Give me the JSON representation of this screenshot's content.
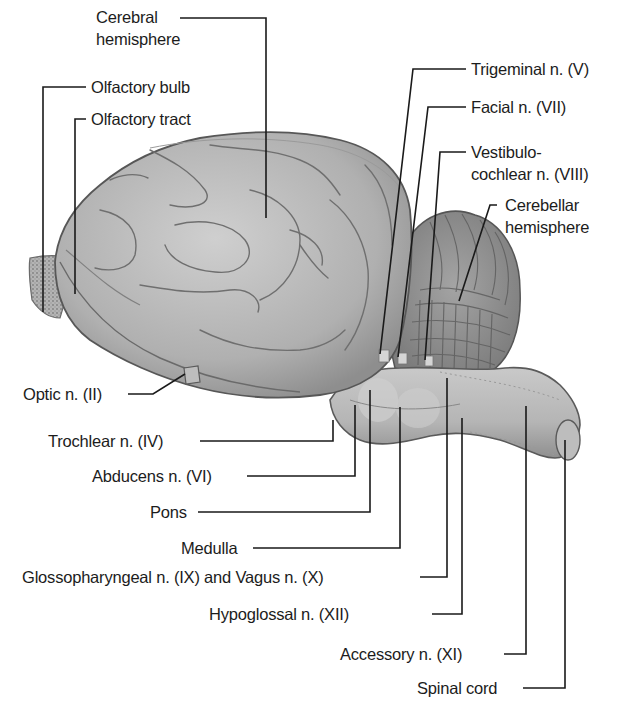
{
  "figure": {
    "colors": {
      "tissue_base": "#a9a9a9",
      "tissue_light": "#c8c8c8",
      "tissue_dark": "#7a7a7a",
      "outline": "#5a5a5a",
      "leader_line": "#1a1a1a",
      "background": "#ffffff"
    }
  },
  "labels": {
    "cerebral_hemisphere": {
      "line1": "Cerebral",
      "line2": "hemisphere"
    },
    "olfactory_bulb": "Olfactory bulb",
    "olfactory_tract": "Olfactory tract",
    "trigeminal": "Trigeminal n. (V)",
    "facial": "Facial n. (VII)",
    "vestibulocochlear": {
      "line1": "Vestibulo-",
      "line2": "cochlear n. (VIII)"
    },
    "cerebellar_hemisphere": {
      "line1": "Cerebellar",
      "line2": "hemisphere"
    },
    "optic": "Optic n. (II)",
    "trochlear": "Trochlear n. (IV)",
    "abducens": "Abducens n. (VI)",
    "pons": "Pons",
    "medulla": "Medulla",
    "glossopharyngeal_vagus": "Glossopharyngeal n. (IX) and Vagus n. (X)",
    "hypoglossal": "Hypoglossal n. (XII)",
    "accessory": "Accessory n. (XI)",
    "spinal_cord": "Spinal cord"
  }
}
